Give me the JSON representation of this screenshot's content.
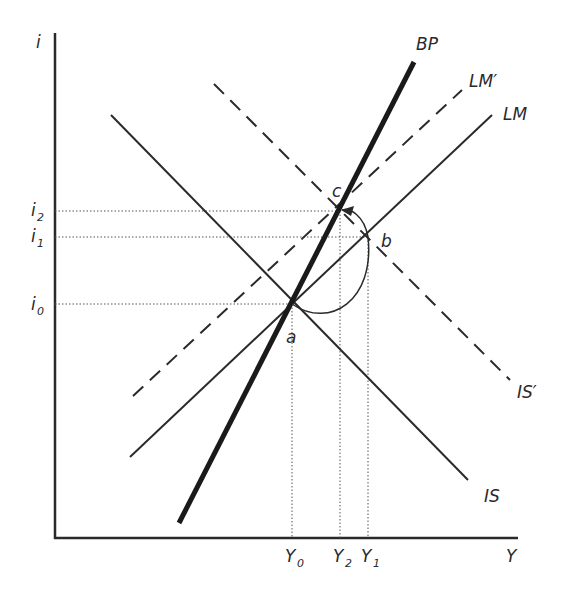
{
  "diagram": {
    "axes": {
      "y_label": "i",
      "x_label": "Y"
    },
    "curves": [
      {
        "id": "IS",
        "label": "IS",
        "style": "solid"
      },
      {
        "id": "IS_prime",
        "label": "IS′",
        "style": "dashed"
      },
      {
        "id": "LM",
        "label": "LM",
        "style": "solid"
      },
      {
        "id": "LM_prime",
        "label": "LM′",
        "style": "dashed"
      },
      {
        "id": "BP",
        "label": "BP",
        "style": "bold"
      }
    ],
    "points": [
      {
        "id": "a",
        "label": "a"
      },
      {
        "id": "b",
        "label": "b"
      },
      {
        "id": "c",
        "label": "c"
      }
    ],
    "y_ticks": [
      {
        "base": "i",
        "sub": "2"
      },
      {
        "base": "i",
        "sub": "1"
      },
      {
        "base": "i",
        "sub": "0"
      }
    ],
    "x_ticks": [
      {
        "base": "Y",
        "sub": "0"
      },
      {
        "base": "Y",
        "sub": "2"
      },
      {
        "base": "Y",
        "sub": "1"
      }
    ],
    "path_annotation": "Adjustment path a → b → c"
  }
}
